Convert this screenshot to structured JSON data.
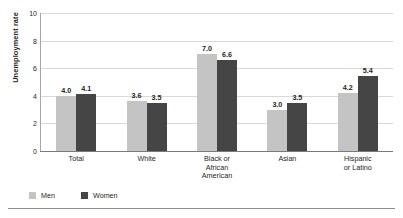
{
  "chart_data": {
    "type": "bar",
    "title": "",
    "subtitle": "",
    "xlabel": "",
    "ylabel": "Unemployment rate",
    "ylim": [
      0,
      10
    ],
    "yticks": [
      0,
      2,
      4,
      6,
      8,
      10
    ],
    "ytick_labels": [
      "0",
      "2",
      "4",
      "6",
      "8",
      "10"
    ],
    "grid": "horizontal",
    "legend_position": "bottom-left",
    "categories": [
      "Total",
      "Black or African American",
      "White",
      "Asian",
      "Hispanic or Latino"
    ],
    "category_labels": [
      [
        "Total"
      ],
      [
        "White"
      ],
      [
        "Black or",
        "African",
        "American"
      ],
      [
        "Asian"
      ],
      [
        "Hispanic",
        "or Latino"
      ]
    ],
    "category_order": [
      "Total",
      "White",
      "Black or African American",
      "Asian",
      "Hispanic or Latino"
    ],
    "series": [
      {
        "name": "Men",
        "color": "#c4c4c4",
        "values": [
          4.0,
          3.6,
          7.0,
          3.0,
          4.2
        ],
        "value_labels": [
          "4.0",
          "3.6",
          "7.0",
          "3.0",
          "4.2"
        ]
      },
      {
        "name": "Women",
        "color": "#454545",
        "values": [
          4.1,
          3.5,
          6.6,
          3.5,
          5.4
        ],
        "value_labels": [
          "4.1",
          "3.5",
          "6.6",
          "3.5",
          "5.4"
        ]
      }
    ]
  },
  "axis": {
    "y_title": "Unemployment rate"
  },
  "legend": {
    "items": [
      {
        "label": "Men",
        "color": "#c4c4c4"
      },
      {
        "label": "Women",
        "color": "#454545"
      }
    ]
  },
  "colors": {
    "men": "#c4c4c4",
    "women": "#454545",
    "gridline": "#d9d9d9",
    "axis": "#7a7a7a",
    "text": "#231f20",
    "background": "#ffffff"
  }
}
